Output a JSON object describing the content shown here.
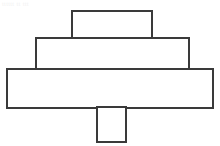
{
  "page": {
    "width": 220,
    "height": 146,
    "background_color": "#ffffff"
  },
  "caption": {
    "text": "tttttt tt ttt",
    "color": "#f2f2f2",
    "note": "nearly invisible faint gray artifact text at top-left"
  },
  "style": {
    "stroke_color": "#3a3a3a",
    "fill_color": "#ffffff",
    "stroke_width": 2
  },
  "chart_data": {
    "type": "diagram",
    "shape_kind": "rectangle",
    "units": "pixels",
    "shapes": [
      {
        "name": "top-rectangle",
        "label": "Rectangle 1 (top)",
        "x": 72,
        "y": 11,
        "width": 80,
        "height": 28,
        "fill": "#ffffff",
        "stroke": "#3a3a3a"
      },
      {
        "name": "upper-middle-rectangle",
        "label": "Rectangle 2 (upper middle)",
        "x": 36,
        "y": 38,
        "width": 153,
        "height": 32,
        "fill": "#ffffff",
        "stroke": "#3a3a3a"
      },
      {
        "name": "wide-base-rectangle",
        "label": "Rectangle 3 (wide base)",
        "x": 7,
        "y": 69,
        "width": 206,
        "height": 39,
        "fill": "#ffffff",
        "stroke": "#3a3a3a"
      },
      {
        "name": "stem-rectangle",
        "label": "Rectangle 4 (stem)",
        "x": 97,
        "y": 107,
        "width": 29,
        "height": 35,
        "fill": "#ffffff",
        "stroke": "#3a3a3a"
      }
    ]
  }
}
